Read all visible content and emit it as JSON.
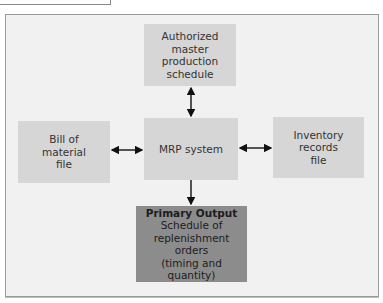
{
  "diagram": {
    "type": "flowchart",
    "nodes": {
      "mps": {
        "lines": [
          "Authorized",
          "master",
          "production",
          "schedule"
        ]
      },
      "bom": {
        "lines": [
          "Bill of",
          "material",
          "file"
        ]
      },
      "mrp": {
        "lines": [
          "MRP system"
        ]
      },
      "inventory": {
        "lines": [
          "Inventory",
          "records",
          "file"
        ]
      },
      "output": {
        "title": "Primary Output",
        "lines": [
          "Schedule of",
          "replenishment orders",
          "(timing and quantity)"
        ]
      }
    },
    "edges": [
      {
        "from": "mps",
        "to": "mrp",
        "direction": "bidirectional"
      },
      {
        "from": "bom",
        "to": "mrp",
        "direction": "bidirectional"
      },
      {
        "from": "mrp",
        "to": "inventory",
        "direction": "bidirectional"
      },
      {
        "from": "mrp",
        "to": "output",
        "direction": "forward"
      }
    ],
    "colors": {
      "frame_bg": "#f1f1f1",
      "box_bg": "#d6d6d6",
      "output_bg": "#8c8c8c",
      "arrow": "#111111"
    }
  }
}
